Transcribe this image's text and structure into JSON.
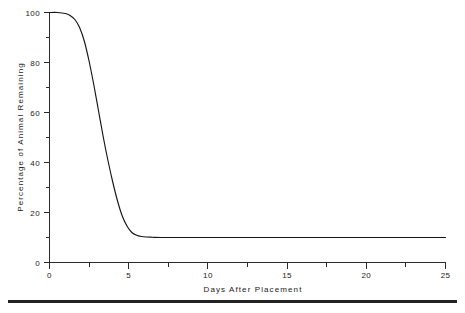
{
  "chart_data": {
    "type": "line",
    "title": "",
    "xlabel": "Days After Placement",
    "ylabel": "Percentage of Animal Remaining",
    "xlim": [
      0,
      25
    ],
    "ylim": [
      0,
      100
    ],
    "grid": false,
    "legend": "none",
    "x_ticks": [
      0,
      5,
      10,
      15,
      20,
      25
    ],
    "x_tick_labels": [
      "0",
      "5",
      "10",
      "15",
      "20",
      "25"
    ],
    "x_minor_tick_interval": 1,
    "y_ticks": [
      0,
      20,
      40,
      60,
      80,
      100
    ],
    "y_tick_labels": [
      "0",
      "20",
      "40",
      "60",
      "80",
      "100"
    ],
    "y_minor_tick_interval": 10,
    "series": [
      {
        "name": "Percentage of Animal Remaining",
        "color": "#161616",
        "x": [
          0.0,
          0.5,
          1.0,
          1.3,
          1.6,
          1.9,
          2.2,
          2.5,
          2.8,
          3.1,
          3.4,
          3.7,
          4.0,
          4.3,
          4.6,
          4.9,
          5.2,
          5.5,
          5.8,
          6.1,
          6.5,
          7.0,
          8.0,
          10.0,
          12.5,
          15.0,
          17.5,
          20.0,
          22.5,
          25.0
        ],
        "y": [
          100.0,
          100.0,
          99.6,
          98.8,
          97.2,
          94.0,
          88.5,
          80.5,
          71.0,
          60.5,
          50.0,
          40.5,
          32.0,
          24.5,
          18.5,
          14.5,
          12.0,
          10.9,
          10.4,
          10.2,
          10.1,
          10.0,
          10.0,
          10.0,
          10.0,
          10.0,
          10.0,
          10.0,
          10.0,
          10.0
        ]
      }
    ]
  },
  "axes": {
    "x_title": "Days After Placement",
    "y_title": "Percentage of Animal Remaining",
    "x_tick_labels": [
      "0",
      "5",
      "10",
      "15",
      "20",
      "25"
    ],
    "y_tick_labels": [
      "0",
      "20",
      "40",
      "60",
      "80",
      "100"
    ]
  },
  "colors": {
    "curve": "#161616",
    "axis": "#2a2a2a",
    "text": "#1a1a1a",
    "background": "#ffffff",
    "footer_rule": "#222222"
  }
}
